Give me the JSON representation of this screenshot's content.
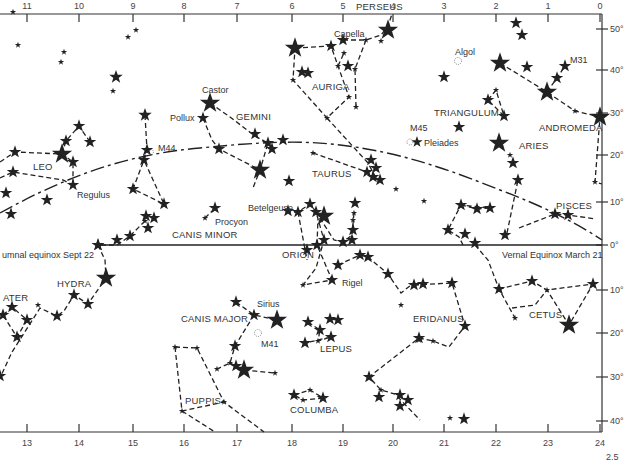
{
  "figure": {
    "colors": {
      "ink": "#222222",
      "paper": "#ffffff",
      "label": "#333333"
    }
  },
  "axes": {
    "top_hours": [
      {
        "label": "11",
        "x": 27
      },
      {
        "label": "10",
        "x": 79
      },
      {
        "label": "9",
        "x": 133
      },
      {
        "label": "8",
        "x": 184
      },
      {
        "label": "7",
        "x": 237
      },
      {
        "label": "6",
        "x": 292
      },
      {
        "label": "5",
        "x": 343
      },
      {
        "label": "4",
        "x": 393
      },
      {
        "label": "3",
        "x": 444
      },
      {
        "label": "2",
        "x": 496
      },
      {
        "label": "1",
        "x": 548
      },
      {
        "label": "0",
        "x": 600
      }
    ],
    "bottom_hours": [
      {
        "label": "13",
        "x": 27
      },
      {
        "label": "14",
        "x": 79
      },
      {
        "label": "15",
        "x": 133
      },
      {
        "label": "16",
        "x": 184
      },
      {
        "label": "17",
        "x": 237
      },
      {
        "label": "18",
        "x": 292
      },
      {
        "label": "19",
        "x": 343
      },
      {
        "label": "20",
        "x": 393
      },
      {
        "label": "21",
        "x": 444
      },
      {
        "label": "22",
        "x": 496
      },
      {
        "label": "23",
        "x": 548
      },
      {
        "label": "24",
        "x": 600
      }
    ],
    "declination": [
      {
        "label": "50°",
        "y": 29
      },
      {
        "label": "40°",
        "y": 70
      },
      {
        "label": "30°",
        "y": 113
      },
      {
        "label": "20°",
        "y": 155
      },
      {
        "label": "10°",
        "y": 202
      },
      {
        "label": "0°",
        "y": 245
      },
      {
        "label": "10°",
        "y": 290
      },
      {
        "label": "20°",
        "y": 333
      },
      {
        "label": "30°",
        "y": 377
      },
      {
        "label": "40°",
        "y": 421
      }
    ]
  },
  "lines": {
    "equator_label_left": "umnal equinox Sept 22",
    "equator_label_right": "Vernal Equinox March  21"
  },
  "constellations": [
    {
      "name": "PERSEUS",
      "x": 356,
      "y": 10
    },
    {
      "name": "AURIGA",
      "x": 312,
      "y": 90
    },
    {
      "name": "GEMINI",
      "x": 236,
      "y": 120
    },
    {
      "name": "TRIANGULUM",
      "x": 434,
      "y": 116
    },
    {
      "name": "ANDROMEDA",
      "x": 539,
      "y": 131
    },
    {
      "name": "ARIES",
      "x": 519,
      "y": 149
    },
    {
      "name": "LEO",
      "x": 33,
      "y": 170
    },
    {
      "name": "TAURUS",
      "x": 312,
      "y": 177
    },
    {
      "name": "CANIS MINOR",
      "x": 172,
      "y": 238
    },
    {
      "name": "PISCES",
      "x": 556,
      "y": 209
    },
    {
      "name": "ORION",
      "x": 282,
      "y": 258
    },
    {
      "name": "HYDRA",
      "x": 57,
      "y": 287
    },
    {
      "name": "ATER",
      "x": 3,
      "y": 301
    },
    {
      "name": "CANIS MAJOR",
      "x": 181,
      "y": 322
    },
    {
      "name": "ERIDANUS",
      "x": 413,
      "y": 322
    },
    {
      "name": "CETUS",
      "x": 529,
      "y": 318
    },
    {
      "name": "LEPUS",
      "x": 320,
      "y": 352
    },
    {
      "name": "PUPPIS",
      "x": 185,
      "y": 404
    },
    {
      "name": "COLUMBA",
      "x": 290,
      "y": 413
    }
  ],
  "named_objects": [
    {
      "name": "Capella",
      "x": 334,
      "y": 37
    },
    {
      "name": "Algol",
      "x": 455,
      "y": 55
    },
    {
      "name": "M31",
      "x": 570,
      "y": 63
    },
    {
      "name": "Castor",
      "x": 202,
      "y": 93
    },
    {
      "name": "Pollux",
      "x": 170,
      "y": 121
    },
    {
      "name": "M44",
      "x": 158,
      "y": 151
    },
    {
      "name": "M45",
      "x": 410,
      "y": 131
    },
    {
      "name": "Pleiades",
      "x": 424,
      "y": 146
    },
    {
      "name": "Regulus",
      "x": 77,
      "y": 198
    },
    {
      "name": "Betelgeuse",
      "x": 248,
      "y": 211
    },
    {
      "name": "Procyon",
      "x": 215,
      "y": 225
    },
    {
      "name": "Rigel",
      "x": 342,
      "y": 286
    },
    {
      "name": "Sirius",
      "x": 257,
      "y": 307
    },
    {
      "name": "M41",
      "x": 261,
      "y": 347
    }
  ],
  "footer": {
    "corner_mark": "2.5"
  },
  "chart_data": {
    "type": "star_map",
    "title": "",
    "x_axis": "Right ascension (hours), top 11→0, bottom 13→24",
    "y_axis": "Declination (degrees), +50° to −40°",
    "features": [
      "celestial equator (solid)",
      "ecliptic (dash-dot)",
      "constellation stick figures (dashed)"
    ]
  }
}
